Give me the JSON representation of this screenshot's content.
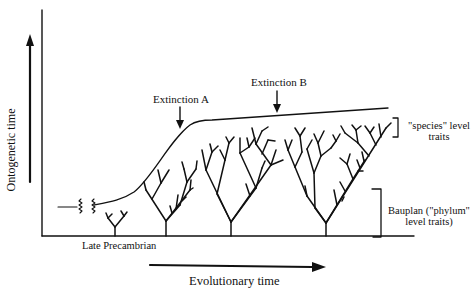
{
  "diagram": {
    "axes": {
      "y_label": "Ontogenetic time",
      "x_label": "Evolutionary time",
      "x_start_label": "Late Precambrian"
    },
    "events": [
      {
        "id": "extinction-a",
        "label": "Extinction A"
      },
      {
        "id": "extinction-b",
        "label": "Extinction B"
      }
    ],
    "brackets": [
      {
        "id": "species-traits",
        "line1": "\"species\" level",
        "line2": "traits"
      },
      {
        "id": "bauplan-traits",
        "line1": "Bauplan (\"phylum\"",
        "line2": "level traits)"
      }
    ],
    "clades": [
      {
        "id": "precambrian-sprig",
        "branching": "minimal"
      },
      {
        "id": "clade-1",
        "branching": "moderate"
      },
      {
        "id": "clade-2",
        "branching": "high"
      },
      {
        "id": "clade-3",
        "branching": "highest"
      }
    ],
    "colors": {
      "ink": "#111111",
      "background": "#ffffff"
    }
  }
}
